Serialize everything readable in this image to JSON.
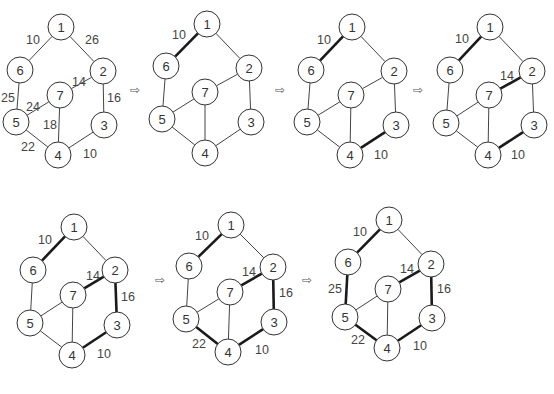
{
  "node_radius": 13,
  "arrow_glyph": "⇨",
  "graph": {
    "nodes": [
      "1",
      "2",
      "3",
      "4",
      "5",
      "6",
      "7"
    ],
    "edges": [
      {
        "id": "1-6",
        "a": "1",
        "b": "6",
        "w": "10"
      },
      {
        "id": "1-2",
        "a": "1",
        "b": "2",
        "w": "26"
      },
      {
        "id": "2-7",
        "a": "2",
        "b": "7",
        "w": "14"
      },
      {
        "id": "2-3",
        "a": "2",
        "b": "3",
        "w": "16"
      },
      {
        "id": "6-5",
        "a": "6",
        "b": "5",
        "w": "25"
      },
      {
        "id": "5-7",
        "a": "5",
        "b": "7",
        "w": "24"
      },
      {
        "id": "7-4",
        "a": "7",
        "b": "4",
        "w": "18"
      },
      {
        "id": "5-4",
        "a": "5",
        "b": "4",
        "w": "22"
      },
      {
        "id": "3-4",
        "a": "3",
        "b": "4",
        "w": "10"
      }
    ]
  },
  "panels": [
    {
      "id": "initial",
      "pos": {
        "1": [
          61,
          27
        ],
        "6": [
          20,
          70
        ],
        "2": [
          103,
          71
        ],
        "7": [
          60,
          95
        ],
        "5": [
          16,
          122
        ],
        "3": [
          104,
          125
        ],
        "4": [
          58,
          155
        ]
      },
      "bold": [],
      "labels": {
        "1-6": [
          33,
          40
        ],
        "1-2": [
          92,
          40
        ],
        "2-7": [
          79,
          82
        ],
        "2-3": [
          114,
          98
        ],
        "6-5": [
          8,
          98
        ],
        "5-7": [
          33,
          107
        ],
        "7-4": [
          50,
          125
        ],
        "5-4": [
          28,
          147
        ],
        "3-4": [
          90,
          154
        ]
      }
    },
    {
      "id": "step1",
      "pos": {
        "1": [
          207,
          24
        ],
        "6": [
          166,
          66
        ],
        "2": [
          249,
          68
        ],
        "7": [
          205,
          92
        ],
        "5": [
          162,
          119
        ],
        "3": [
          251,
          122
        ],
        "4": [
          205,
          153
        ]
      },
      "bold": [
        "1-6"
      ],
      "labels": {
        "1-6": [
          179,
          35
        ]
      }
    },
    {
      "id": "step2",
      "pos": {
        "1": [
          352,
          27
        ],
        "6": [
          311,
          70
        ],
        "2": [
          394,
          71
        ],
        "7": [
          351,
          95
        ],
        "5": [
          307,
          122
        ],
        "3": [
          396,
          125
        ],
        "4": [
          350,
          155
        ]
      },
      "bold": [
        "1-6",
        "3-4"
      ],
      "labels": {
        "1-6": [
          324,
          40
        ],
        "3-4": [
          381,
          155
        ]
      }
    },
    {
      "id": "step3",
      "pos": {
        "1": [
          490,
          27
        ],
        "6": [
          450,
          70
        ],
        "2": [
          532,
          71
        ],
        "7": [
          489,
          95
        ],
        "5": [
          446,
          123
        ],
        "3": [
          534,
          125
        ],
        "4": [
          488,
          155
        ]
      },
      "bold": [
        "1-6",
        "3-4",
        "2-7"
      ],
      "labels": {
        "1-6": [
          462,
          39
        ],
        "2-7": [
          507,
          76
        ],
        "3-4": [
          518,
          155
        ]
      }
    },
    {
      "id": "step4",
      "pos": {
        "1": [
          74,
          227
        ],
        "6": [
          33,
          270
        ],
        "2": [
          115,
          270
        ],
        "7": [
          73,
          295
        ],
        "5": [
          30,
          323
        ],
        "3": [
          117,
          325
        ],
        "4": [
          72,
          355
        ]
      },
      "bold": [
        "1-6",
        "3-4",
        "2-7",
        "2-3"
      ],
      "labels": {
        "1-6": [
          45,
          240
        ],
        "2-7": [
          93,
          276
        ],
        "2-3": [
          128,
          297
        ],
        "3-4": [
          104,
          354
        ]
      }
    },
    {
      "id": "step5",
      "pos": {
        "1": [
          231,
          225
        ],
        "6": [
          189,
          266
        ],
        "2": [
          273,
          267
        ],
        "7": [
          230,
          292
        ],
        "5": [
          186,
          319
        ],
        "3": [
          274,
          322
        ],
        "4": [
          228,
          352
        ]
      },
      "bold": [
        "1-6",
        "3-4",
        "2-7",
        "2-3",
        "5-4"
      ],
      "labels": {
        "1-6": [
          202,
          236
        ],
        "2-7": [
          249,
          272
        ],
        "2-3": [
          286,
          293
        ],
        "5-4": [
          199,
          344
        ],
        "3-4": [
          262,
          350
        ]
      }
    },
    {
      "id": "step6",
      "pos": {
        "1": [
          389,
          220
        ],
        "6": [
          348,
          262
        ],
        "2": [
          431,
          264
        ],
        "7": [
          388,
          289
        ],
        "5": [
          345,
          317
        ],
        "3": [
          432,
          318
        ],
        "4": [
          387,
          348
        ]
      },
      "bold": [
        "1-6",
        "3-4",
        "2-7",
        "2-3",
        "5-4",
        "6-5"
      ],
      "labels": {
        "1-6": [
          360,
          232
        ],
        "2-7": [
          407,
          269
        ],
        "2-3": [
          444,
          289
        ],
        "6-5": [
          335,
          289
        ],
        "5-4": [
          358,
          340
        ],
        "3-4": [
          420,
          346
        ]
      }
    }
  ],
  "arrows": [
    [
      135,
      90
    ],
    [
      280,
      90
    ],
    [
      418,
      90
    ],
    [
      160,
      280
    ],
    [
      307,
      280
    ]
  ]
}
